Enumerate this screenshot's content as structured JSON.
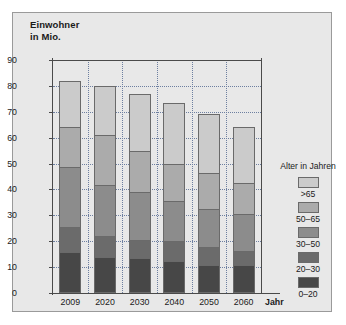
{
  "chart_data": {
    "type": "bar",
    "title": "Einwohner\nin Mio.",
    "xlabel": "Jahr",
    "ylabel": "Einwohner in Mio.",
    "ylim": [
      0,
      90
    ],
    "ytick_step": 10,
    "grid": true,
    "stacked": true,
    "legend_position": "right",
    "legend_title": "Alter in Jahren",
    "categories": [
      "2009",
      "2020",
      "2030",
      "2040",
      "2050",
      "2060"
    ],
    "ytick_labels": [
      "90",
      "80",
      "70",
      "60",
      "50",
      "40",
      "30",
      "20",
      "10",
      "0"
    ],
    "series": [
      {
        "name": "0–20",
        "color": "#474747",
        "values": [
          15.5,
          13.5,
          13.0,
          12.0,
          10.5,
          10.5
        ]
      },
      {
        "name": "20–30",
        "color": "#6b6b6b",
        "values": [
          9.5,
          8.0,
          7.0,
          7.5,
          6.5,
          5.0
        ]
      },
      {
        "name": "30–50",
        "color": "#8c8c8c",
        "values": [
          23.5,
          20.0,
          18.5,
          15.5,
          15.0,
          14.5
        ]
      },
      {
        "name": "50–65",
        "color": "#ababab",
        "values": [
          15.5,
          19.5,
          16.0,
          14.5,
          14.0,
          12.0
        ]
      },
      {
        "name": ">65",
        "color": "#cbcbcb",
        "values": [
          18.0,
          19.0,
          22.5,
          24.0,
          23.0,
          22.0
        ]
      }
    ],
    "totals": [
      82.0,
      80.0,
      77.0,
      73.5,
      69.0,
      64.0
    ],
    "legend_entries": [
      {
        "label": ">65",
        "color": "#cbcbcb"
      },
      {
        "label": "50–65",
        "color": "#ababab"
      },
      {
        "label": "30–50",
        "color": "#8c8c8c"
      },
      {
        "label": "20–30",
        "color": "#6b6b6b"
      },
      {
        "label": "0–20",
        "color": "#474747"
      }
    ]
  },
  "colors": {
    "panel_background": "#e8e8e8",
    "page_background": "#ffffff",
    "axis": "#4a4a4a",
    "gridline": "#6d7fa0",
    "bar_outline": "#6a6a6a"
  }
}
